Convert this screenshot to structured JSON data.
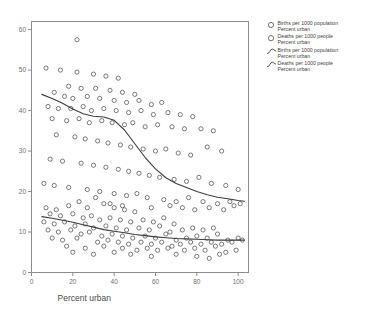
{
  "chart_data": {
    "type": "scatter",
    "title": "",
    "xlabel": "Percent urban",
    "ylabel": "",
    "xlim": [
      0,
      105
    ],
    "ylim": [
      0,
      62
    ],
    "xticks": [
      "0",
      "20",
      "40",
      "60",
      "80",
      "100"
    ],
    "xtick_values": [
      0,
      20,
      40,
      60,
      80,
      100
    ],
    "yticks": [
      "0",
      "10",
      "20",
      "30",
      "40",
      "50",
      "60"
    ],
    "ytick_values": [
      0,
      10,
      20,
      30,
      40,
      50,
      60
    ],
    "grid": false,
    "legend_position": "right",
    "series": [
      {
        "name": "Births per 1000 population",
        "marker": "open-circle",
        "type": "scatter",
        "points": [
          [
            22,
            57.5
          ],
          [
            7,
            50.5
          ],
          [
            14,
            50.0
          ],
          [
            22,
            49.5
          ],
          [
            30,
            49.0
          ],
          [
            36,
            48.5
          ],
          [
            42,
            48.0
          ],
          [
            18,
            46.0
          ],
          [
            24,
            45.5
          ],
          [
            31,
            45.5
          ],
          [
            38,
            45.0
          ],
          [
            44,
            44.5
          ],
          [
            50,
            44.0
          ],
          [
            11,
            44.5
          ],
          [
            16,
            43.5
          ],
          [
            20,
            43.0
          ],
          [
            27,
            43.5
          ],
          [
            33,
            43.0
          ],
          [
            40,
            42.5
          ],
          [
            46,
            42.0
          ],
          [
            52,
            42.5
          ],
          [
            58,
            41.5
          ],
          [
            63,
            42.0
          ],
          [
            8,
            41.0
          ],
          [
            13,
            40.5
          ],
          [
            19,
            40.5
          ],
          [
            25,
            41.0
          ],
          [
            29,
            40.0
          ],
          [
            35,
            40.5
          ],
          [
            41,
            40.0
          ],
          [
            47,
            39.5
          ],
          [
            53,
            40.0
          ],
          [
            59,
            39.0
          ],
          [
            66,
            39.5
          ],
          [
            72,
            39.0
          ],
          [
            78,
            38.5
          ],
          [
            10,
            38.0
          ],
          [
            17,
            37.5
          ],
          [
            23,
            38.0
          ],
          [
            28,
            37.0
          ],
          [
            34,
            37.5
          ],
          [
            39,
            37.0
          ],
          [
            45,
            36.5
          ],
          [
            49,
            37.0
          ],
          [
            55,
            36.0
          ],
          [
            61,
            36.5
          ],
          [
            68,
            36.0
          ],
          [
            74,
            35.5
          ],
          [
            82,
            35.5
          ],
          [
            88,
            35.0
          ],
          [
            12,
            34.0
          ],
          [
            21,
            33.5
          ],
          [
            26,
            33.0
          ],
          [
            32,
            32.5
          ],
          [
            37,
            32.0
          ],
          [
            43,
            31.5
          ],
          [
            48,
            31.0
          ],
          [
            54,
            30.5
          ],
          [
            60,
            30.0
          ],
          [
            65,
            30.5
          ],
          [
            71,
            29.5
          ],
          [
            77,
            29.0
          ],
          [
            85,
            31.0
          ],
          [
            92,
            30.0
          ],
          [
            9,
            28.0
          ],
          [
            15,
            27.5
          ],
          [
            24,
            27.0
          ],
          [
            30,
            26.5
          ],
          [
            36,
            26.0
          ],
          [
            42,
            25.5
          ],
          [
            47,
            25.0
          ],
          [
            52,
            24.5
          ],
          [
            57,
            24.0
          ],
          [
            62,
            23.5
          ],
          [
            69,
            23.0
          ],
          [
            75,
            22.5
          ],
          [
            81,
            23.5
          ],
          [
            87,
            22.0
          ],
          [
            94,
            21.5
          ],
          [
            100,
            20.5
          ],
          [
            6,
            22.0
          ],
          [
            11,
            21.5
          ],
          [
            18,
            21.0
          ],
          [
            27,
            20.5
          ],
          [
            33,
            20.0
          ],
          [
            40,
            19.5
          ],
          [
            46,
            19.0
          ],
          [
            51,
            19.5
          ],
          [
            56,
            18.5
          ],
          [
            64,
            18.0
          ],
          [
            70,
            17.5
          ],
          [
            76,
            18.5
          ],
          [
            83,
            17.5
          ],
          [
            90,
            17.0
          ],
          [
            96,
            17.5
          ],
          [
            101,
            17.0
          ],
          [
            38,
            17.0
          ],
          [
            44,
            16.5
          ],
          [
            58,
            16.0
          ],
          [
            67,
            16.5
          ],
          [
            73,
            16.0
          ],
          [
            79,
            15.5
          ],
          [
            86,
            16.0
          ],
          [
            93,
            15.5
          ],
          [
            98,
            16.5
          ]
        ]
      },
      {
        "name": "Deaths per 1000 people",
        "marker": "open-circle",
        "type": "scatter",
        "points": [
          [
            7,
            16.0
          ],
          [
            12,
            15.5
          ],
          [
            18,
            16.5
          ],
          [
            23,
            17.5
          ],
          [
            27,
            16.0
          ],
          [
            31,
            18.5
          ],
          [
            35,
            17.0
          ],
          [
            40,
            16.0
          ],
          [
            45,
            15.5
          ],
          [
            50,
            15.0
          ],
          [
            9,
            14.5
          ],
          [
            14,
            14.0
          ],
          [
            20,
            14.5
          ],
          [
            25,
            13.5
          ],
          [
            29,
            14.0
          ],
          [
            33,
            13.0
          ],
          [
            38,
            13.5
          ],
          [
            43,
            13.0
          ],
          [
            48,
            12.5
          ],
          [
            54,
            13.0
          ],
          [
            59,
            12.5
          ],
          [
            64,
            13.5
          ],
          [
            69,
            12.0
          ],
          [
            6,
            12.5
          ],
          [
            11,
            12.0
          ],
          [
            16,
            12.5
          ],
          [
            21,
            11.5
          ],
          [
            26,
            12.0
          ],
          [
            30,
            11.0
          ],
          [
            36,
            11.5
          ],
          [
            41,
            11.0
          ],
          [
            46,
            10.5
          ],
          [
            52,
            11.0
          ],
          [
            57,
            10.5
          ],
          [
            62,
            11.5
          ],
          [
            67,
            10.0
          ],
          [
            73,
            10.5
          ],
          [
            78,
            11.0
          ],
          [
            83,
            10.5
          ],
          [
            88,
            11.0
          ],
          [
            8,
            10.5
          ],
          [
            13,
            10.0
          ],
          [
            19,
            10.5
          ],
          [
            24,
            9.5
          ],
          [
            28,
            10.0
          ],
          [
            34,
            9.0
          ],
          [
            39,
            9.5
          ],
          [
            44,
            9.0
          ],
          [
            49,
            8.5
          ],
          [
            55,
            9.0
          ],
          [
            60,
            8.5
          ],
          [
            65,
            9.5
          ],
          [
            70,
            8.0
          ],
          [
            75,
            8.5
          ],
          [
            80,
            9.0
          ],
          [
            85,
            8.5
          ],
          [
            90,
            9.5
          ],
          [
            95,
            8.0
          ],
          [
            100,
            8.5
          ],
          [
            10,
            8.5
          ],
          [
            15,
            8.0
          ],
          [
            22,
            8.5
          ],
          [
            32,
            7.5
          ],
          [
            37,
            8.0
          ],
          [
            42,
            7.5
          ],
          [
            47,
            7.0
          ],
          [
            53,
            7.5
          ],
          [
            58,
            7.0
          ],
          [
            63,
            7.5
          ],
          [
            68,
            6.5
          ],
          [
            72,
            7.0
          ],
          [
            77,
            7.5
          ],
          [
            82,
            7.0
          ],
          [
            87,
            7.5
          ],
          [
            92,
            7.0
          ],
          [
            97,
            7.5
          ],
          [
            102,
            8.0
          ],
          [
            17,
            6.5
          ],
          [
            26,
            6.0
          ],
          [
            35,
            6.5
          ],
          [
            44,
            6.0
          ],
          [
            51,
            5.5
          ],
          [
            56,
            6.0
          ],
          [
            61,
            5.5
          ],
          [
            66,
            6.0
          ],
          [
            74,
            5.5
          ],
          [
            79,
            6.0
          ],
          [
            84,
            5.5
          ],
          [
            89,
            6.5
          ],
          [
            94,
            5.0
          ],
          [
            20,
            5.0
          ],
          [
            30,
            4.5
          ],
          [
            40,
            5.0
          ],
          [
            48,
            4.5
          ],
          [
            58,
            4.0
          ],
          [
            70,
            4.5
          ],
          [
            80,
            4.0
          ],
          [
            86,
            3.5
          ],
          [
            91,
            4.5
          ],
          [
            99,
            5.5
          ]
        ]
      },
      {
        "name": "Births per 1000 population",
        "marker": "curve",
        "type": "line",
        "points": [
          [
            5,
            44.0
          ],
          [
            10,
            43.0
          ],
          [
            15,
            41.8
          ],
          [
            20,
            40.4
          ],
          [
            25,
            39.2
          ],
          [
            30,
            38.6
          ],
          [
            35,
            38.4
          ],
          [
            40,
            37.6
          ],
          [
            45,
            35.2
          ],
          [
            50,
            31.8
          ],
          [
            55,
            28.4
          ],
          [
            60,
            25.6
          ],
          [
            65,
            23.4
          ],
          [
            70,
            22.0
          ],
          [
            75,
            21.0
          ],
          [
            80,
            20.0
          ],
          [
            85,
            19.2
          ],
          [
            90,
            18.6
          ],
          [
            95,
            18.2
          ],
          [
            100,
            17.8
          ],
          [
            103,
            17.6
          ]
        ]
      },
      {
        "name": "Deaths per 1000 people",
        "marker": "curve",
        "type": "line",
        "points": [
          [
            5,
            13.8
          ],
          [
            10,
            13.4
          ],
          [
            15,
            12.9
          ],
          [
            20,
            12.4
          ],
          [
            25,
            11.8
          ],
          [
            30,
            11.2
          ],
          [
            35,
            10.6
          ],
          [
            40,
            10.2
          ],
          [
            45,
            9.8
          ],
          [
            50,
            9.4
          ],
          [
            55,
            9.1
          ],
          [
            60,
            8.8
          ],
          [
            65,
            8.6
          ],
          [
            70,
            8.4
          ],
          [
            75,
            8.3
          ],
          [
            80,
            8.2
          ],
          [
            85,
            8.1
          ],
          [
            90,
            8.0
          ],
          [
            95,
            8.0
          ],
          [
            100,
            8.0
          ],
          [
            103,
            8.0
          ]
        ]
      }
    ],
    "legend": [
      {
        "glyph": "open-circle",
        "line1": "Births per 1000 population",
        "line2": "Percent urban"
      },
      {
        "glyph": "open-circle",
        "line1": "Deaths per 1000 people",
        "line2": "Percent urban"
      },
      {
        "glyph": "curve",
        "line1": "Births per 1000 population",
        "line2": "Percent urban"
      },
      {
        "glyph": "curve",
        "line1": "Deaths per 1000 people",
        "line2": "Percent urban"
      }
    ]
  }
}
